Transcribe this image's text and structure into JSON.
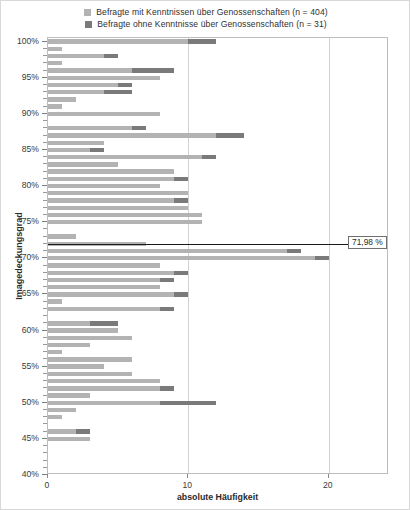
{
  "legend": {
    "position": "top-center",
    "items": [
      {
        "label": "Befragte mit Kenntnissen über Genossenschaften (n = 404)",
        "color": "#b3b3b3",
        "key": "mit"
      },
      {
        "label": "Befragte ohne Kenntnisse über Genossenschaften (n = 31)",
        "color": "#7a7a7a",
        "key": "ohne"
      }
    ]
  },
  "chart_data": {
    "type": "bar",
    "orientation": "horizontal",
    "stacked": true,
    "title": "",
    "xlabel": "absolute Häufigkeit",
    "ylabel": "Imagedeckungsgrad",
    "xlim": [
      0,
      24.3
    ],
    "ylim": [
      40,
      100.5
    ],
    "xticks": [
      0,
      10,
      20
    ],
    "xtick_labels": [
      "0",
      "10",
      "20"
    ],
    "yticks": [
      40,
      45,
      50,
      55,
      60,
      65,
      70,
      75,
      80,
      85,
      90,
      95,
      100
    ],
    "ytick_labels": [
      "40%",
      "45%",
      "50%",
      "55%",
      "60%",
      "65%",
      "70%",
      "75%",
      "80%",
      "85%",
      "90%",
      "95%",
      "100%"
    ],
    "minor_ytick_step": 1,
    "grid": false,
    "gridlines_x": [
      10,
      20
    ],
    "series": [
      {
        "name": "Befragte mit Kenntnissen über Genossenschaften (n = 404)",
        "color": "#b3b3b3"
      },
      {
        "name": "Befragte ohne Kenntnisse über Genossenschaften (n = 31)",
        "color": "#7a7a7a"
      }
    ],
    "categories": [
      100,
      99,
      98,
      97,
      96,
      95,
      94,
      93,
      92,
      91,
      90,
      89,
      88,
      87,
      86,
      85,
      84,
      83,
      82,
      81,
      80,
      79,
      78,
      77,
      76,
      75,
      74,
      73,
      72,
      71,
      70,
      69,
      68,
      67,
      66,
      65,
      64,
      63,
      62,
      61,
      60,
      59,
      58,
      57,
      56,
      55,
      54,
      53,
      52,
      51,
      50,
      49,
      48,
      47,
      46,
      45,
      44,
      43,
      42,
      41,
      40
    ],
    "values_mit": [
      10,
      1,
      4,
      1,
      6,
      8,
      5,
      4,
      2,
      1,
      8,
      0,
      6,
      12,
      4,
      3,
      11,
      5,
      9,
      9,
      8,
      10,
      9,
      10,
      11,
      11,
      0,
      2,
      7,
      17,
      19,
      8,
      9,
      8,
      8,
      9,
      1,
      8,
      0,
      3,
      5,
      6,
      3,
      1,
      6,
      4,
      6,
      8,
      8,
      3,
      8,
      2,
      1,
      0,
      2,
      3,
      0,
      0,
      0,
      0,
      0
    ],
    "values_ohne": [
      2,
      0,
      1,
      0,
      3,
      0,
      1,
      2,
      0,
      0,
      0,
      0,
      1,
      2,
      0,
      1,
      1,
      0,
      0,
      1,
      0,
      0,
      1,
      0,
      0,
      0,
      0,
      0,
      0,
      1,
      1,
      0,
      1,
      1,
      0,
      1,
      0,
      1,
      0,
      2,
      0,
      0,
      0,
      0,
      0,
      0,
      0,
      0,
      1,
      0,
      4,
      0,
      0,
      0,
      1,
      0,
      0,
      0,
      0,
      0,
      0
    ],
    "annotations": [
      {
        "type": "reference-line",
        "axis": "y",
        "value": 71.98,
        "label": "71,98 %",
        "color": "#1a1a1a"
      }
    ]
  }
}
